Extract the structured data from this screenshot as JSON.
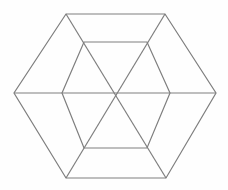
{
  "figure": {
    "name": "hexagon-wireframe-diagram",
    "background": "#fefefe",
    "stroke_color": "#7e7e7e",
    "stroke_width": 1.2,
    "width": 228,
    "height": 190,
    "shapes": [
      {
        "name": "outer-hexagon",
        "type": "polygon",
        "points": [
          [
            66,
            14
          ],
          [
            165,
            14
          ],
          [
            216,
            93
          ],
          [
            166,
            178
          ],
          [
            66,
            178
          ],
          [
            14,
            93
          ]
        ]
      },
      {
        "name": "inner-hexagon",
        "type": "polygon",
        "points": [
          [
            84,
            42
          ],
          [
            147,
            42
          ],
          [
            170,
            93
          ],
          [
            147,
            148
          ],
          [
            84,
            148
          ],
          [
            62,
            93
          ]
        ]
      },
      {
        "name": "diagonal-left-right",
        "type": "line",
        "points": [
          [
            14,
            93
          ],
          [
            216,
            93
          ]
        ]
      },
      {
        "name": "diagonal-topleft-bottomright",
        "type": "line",
        "points": [
          [
            66,
            14
          ],
          [
            166,
            178
          ]
        ]
      },
      {
        "name": "diagonal-topright-bottomleft",
        "type": "line",
        "points": [
          [
            165,
            14
          ],
          [
            66,
            178
          ]
        ]
      }
    ]
  }
}
